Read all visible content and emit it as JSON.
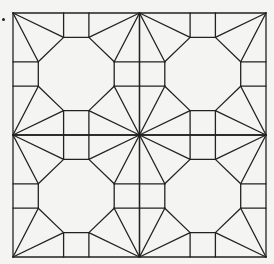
{
  "figure": {
    "type": "geometric-tiling-pattern",
    "bbox": {
      "x0": 13,
      "y0": 13,
      "x1": 266,
      "y1": 257
    },
    "grid": {
      "cols": 2,
      "rows": 2
    },
    "octagon_fractions": [
      0.2,
      0.4,
      0.6,
      0.8
    ],
    "line_color": "#222222",
    "background_color": "#f4f4f2",
    "line_width": 1.3
  },
  "bullet": {
    "x": 2,
    "y": 18
  }
}
